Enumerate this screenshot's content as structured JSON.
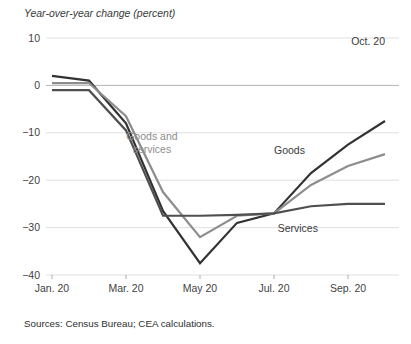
{
  "chart_data": {
    "type": "line",
    "title": "Year-over-year change (percent)",
    "xlabel": "",
    "ylabel": "",
    "ylim": [
      -40,
      10
    ],
    "yticks": [
      10,
      0,
      -10,
      -20,
      -30,
      -40
    ],
    "ytick_labels": [
      "10",
      "0",
      "−10",
      "−20",
      "−30",
      "−40"
    ],
    "grid": true,
    "legend_position": "inline-labels",
    "x": [
      "Jan. 20",
      "Feb. 20",
      "Mar. 20",
      "Apr. 20",
      "May 20",
      "Jun. 20",
      "Jul. 20",
      "Aug. 20",
      "Sep. 20",
      "Oct. 20"
    ],
    "xtick_labels": [
      "Jan. 20",
      "Mar. 20",
      "May 20",
      "Jul. 20",
      "Sep. 20"
    ],
    "xtick_indices": [
      0,
      2,
      4,
      6,
      8
    ],
    "annotations": [
      {
        "text": "Oct. 20",
        "x_index": 9,
        "value": 8.5,
        "align": "end",
        "color": "#3a3a3a"
      }
    ],
    "series": [
      {
        "name": "Goods",
        "color": "#333333",
        "width": 2.2,
        "label_x_index": 6.0,
        "label_value": -14.5,
        "values": [
          2.0,
          1.0,
          -8.0,
          -26.5,
          -37.5,
          -29.0,
          -27.0,
          -18.5,
          -12.5,
          -7.5
        ]
      },
      {
        "name": "Goods and services",
        "color": "#8d8d8d",
        "width": 2.2,
        "label_x_index": 2.7,
        "label_value": -11.5,
        "values": [
          0.5,
          0.5,
          -6.5,
          -22.5,
          -32.0,
          -27.5,
          -27.0,
          -21.0,
          -17.0,
          -14.5
        ]
      },
      {
        "name": "Services",
        "color": "#4f4f4f",
        "width": 2.2,
        "label_x_index": 6.1,
        "label_value": -31.0,
        "values": [
          -1.0,
          -1.0,
          -9.5,
          -27.5,
          -27.5,
          -27.3,
          -27.0,
          -25.5,
          -25.0,
          -25.0
        ]
      }
    ],
    "source": "Sources: Census Bureau; CEA calculations."
  }
}
